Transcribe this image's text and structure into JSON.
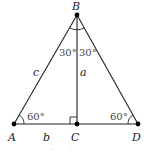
{
  "diagram": {
    "points": {
      "A": {
        "label": "A",
        "x": 14,
        "y": 124
      },
      "B": {
        "label": "B",
        "x": 77,
        "y": 15
      },
      "C": {
        "label": "C",
        "x": 77,
        "y": 124
      },
      "D": {
        "label": "D",
        "x": 138,
        "y": 124
      }
    },
    "sides": {
      "c": "c",
      "a": "a",
      "b": "b"
    },
    "angles": {
      "A": "60°",
      "D": "60°",
      "B_left": "30°",
      "B_right": "30°"
    },
    "colors": {
      "line": "#222222",
      "point": "#000000"
    }
  }
}
